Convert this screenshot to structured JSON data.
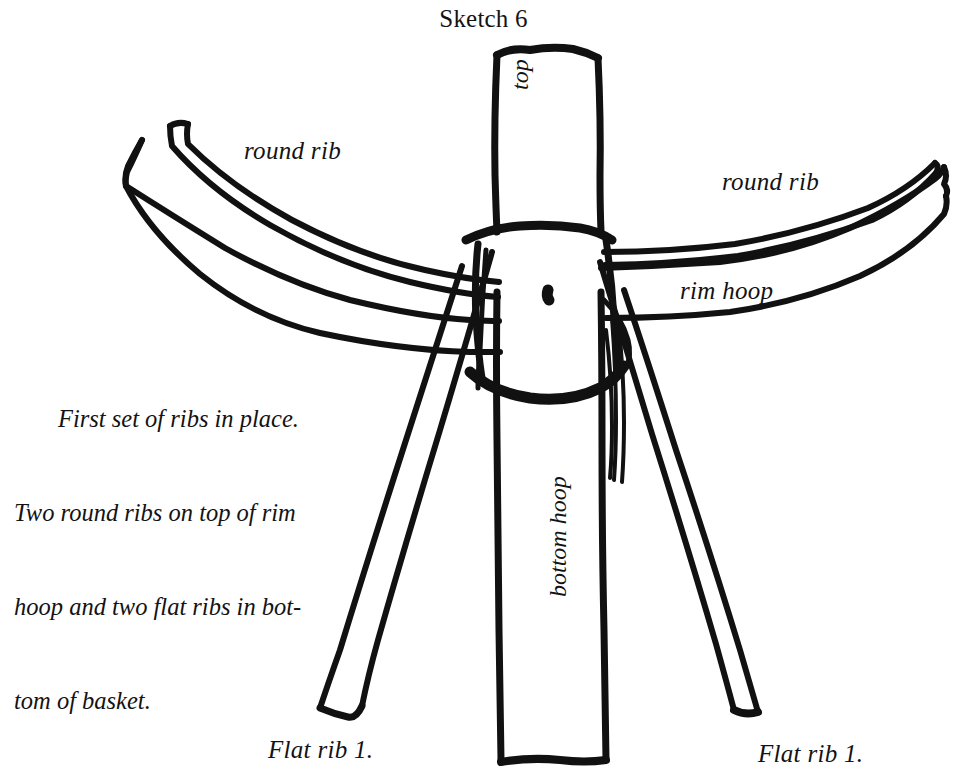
{
  "document": {
    "title": "Sketch 6",
    "background_color": "#ffffff",
    "ink_color": "#111111",
    "figure_type": "hand-drawn basket construction sketch"
  },
  "labels": {
    "round_rib_left": "round rib",
    "round_rib_right": "round rib",
    "rim_hoop": "rim hoop",
    "top": "top",
    "bottom_hoop": "bottom hoop",
    "flat_rib_left": "Flat rib 1.",
    "flat_rib_right": "Flat rib 1."
  },
  "caption": {
    "full_text": "First set of ribs in place. Two round ribs on top of rim hoop and two flat ribs in bottom of basket.",
    "lines": [
      "First set of ribs in place.",
      "Two round ribs on top of rim",
      "hoop and two flat ribs in bot-",
      "tom of basket."
    ]
  }
}
